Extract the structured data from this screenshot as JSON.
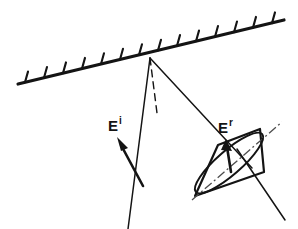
{
  "figure": {
    "background_color": "#ffffff",
    "ink_color": "#141414",
    "width": 298,
    "height": 229
  },
  "labels": {
    "incident_field": {
      "base": "E",
      "superscript": "i",
      "x": 108,
      "y": 131
    },
    "reflected_field": {
      "base": "E",
      "superscript": "r",
      "x": 218,
      "y": 133
    }
  },
  "surface": {
    "name": "hatched-boundary-surface",
    "x1": 18,
    "y1": 84,
    "x2": 284,
    "y2": 20,
    "tick_count": 14,
    "tick_length": 11,
    "tick_color": "#141414"
  },
  "rays": {
    "incident": {
      "name": "incident-ray",
      "x1": 150,
      "y1": 58,
      "x2": 128,
      "y2": 229,
      "style": "solid"
    },
    "normal": {
      "name": "surface-normal",
      "x1": 150,
      "y1": 58,
      "x2": 157,
      "y2": 113,
      "style": "dashed"
    },
    "reflected": {
      "name": "reflected-ray",
      "x1": 150,
      "y1": 58,
      "x2": 252,
      "y2": 168,
      "style": "solid"
    },
    "through_ellipse": {
      "name": "ellipse-through-ray",
      "x1": 237,
      "y1": 149,
      "x2": 285,
      "y2": 220,
      "style": "solid"
    },
    "ellipse_major_axis": {
      "name": "ellipse-major-axis",
      "x1": 192,
      "y1": 200,
      "x2": 282,
      "y2": 122,
      "style": "dash-dot"
    }
  },
  "incident_vector": {
    "name": "incident-field-vector",
    "tail_x": 143,
    "tail_y": 186,
    "head_x": 118,
    "head_y": 140,
    "arrowhead": "filled-triangle"
  },
  "reflected_vector": {
    "name": "reflected-field-vector",
    "tail_x": 231,
    "tail_y": 170,
    "head_x": 226,
    "head_y": 141,
    "arrowhead": "filled-triangle"
  },
  "polarization_plane": {
    "name": "polarization-plane-parallelogram",
    "corners": [
      {
        "x": 218,
        "y": 145
      },
      {
        "x": 260,
        "y": 129
      },
      {
        "x": 264,
        "y": 172
      },
      {
        "x": 195,
        "y": 196
      }
    ]
  },
  "polarization_ellipse": {
    "name": "polarization-ellipse",
    "center_x": 229,
    "center_y": 163,
    "rx": 44,
    "ry": 12,
    "rotation_deg": -41,
    "description": "elliptically polarized reflected field traced in the plane"
  }
}
